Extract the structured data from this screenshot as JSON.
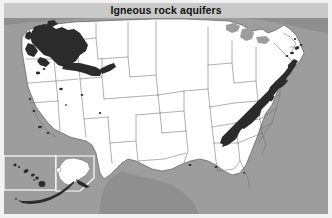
{
  "title": "Igneous rock aquifers",
  "map": {
    "name": "united-states-igneous-rock-aquifers-map",
    "projection_note": "Conterminous United States with Alaska and Hawaii insets",
    "colors": {
      "ocean": "#9d9d9d",
      "land_outside": "#9d9d9d",
      "state_fill": "#ffffff",
      "state_outline": "#6e6e6e",
      "aquifer_fill": "#2b2b2b",
      "title_band": "#c9c9c9",
      "title_text": "#111111",
      "frame": "#f2f2f2",
      "inset_border": "#ffffff"
    },
    "aquifer_regions": [
      {
        "name": "columbia-plateau-basalt",
        "label": "Columbia Plateau / Snake River Plain basalt",
        "region": "Pacific Northwest"
      },
      {
        "name": "snake-river-plain",
        "label": "Snake River Plain",
        "region": "Idaho"
      },
      {
        "name": "appalachian-piedmont-crystalline",
        "label": "Piedmont and Blue Ridge crystalline rock",
        "region": "Eastern Seaboard"
      },
      {
        "name": "new-england-crystalline",
        "label": "New England crystalline rock",
        "region": "Northeast"
      },
      {
        "name": "hawaiian-volcanic",
        "label": "Hawaiian volcanic rock",
        "region": "Hawaii"
      },
      {
        "name": "aleutian-volcanic",
        "label": "Aleutian volcanic arc",
        "region": "Alaska"
      },
      {
        "name": "sierra-nevada-specks",
        "label": "Scattered igneous outcrops",
        "region": "California / Nevada"
      }
    ],
    "insets": [
      {
        "name": "hawaii-inset",
        "label": "Hawaii"
      },
      {
        "name": "alaska-inset",
        "label": "Alaska"
      }
    ]
  }
}
